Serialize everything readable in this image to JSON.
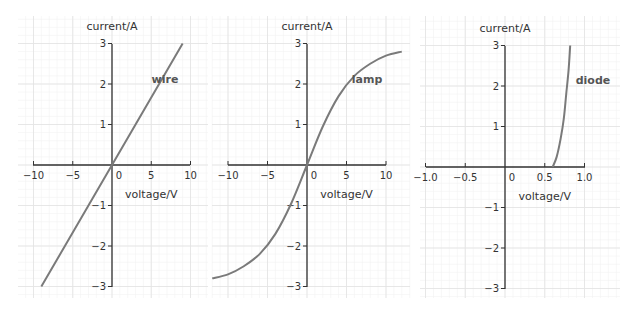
{
  "colors": {
    "background": "#ffffff",
    "grid_major": "#e4e4e4",
    "grid_minor": "#f2f2f2",
    "axis": "#333333",
    "curve": "#7a7a7a",
    "text": "#333333"
  },
  "chart_data": [
    {
      "type": "line",
      "title": "",
      "curve_label": "wire",
      "xlabel": "voltage/V",
      "ylabel": "current/A",
      "xlim": [
        -10,
        10
      ],
      "ylim": [
        -3,
        3
      ],
      "x_ticks": [
        -10,
        -5,
        0,
        5,
        10
      ],
      "x_tick_labels": [
        "−10",
        "−5",
        "0",
        "5",
        "10"
      ],
      "y_ticks": [
        -3,
        -2,
        -1,
        1,
        2,
        3
      ],
      "y_tick_labels": [
        "−3",
        "−2",
        "−1",
        "1",
        "2",
        "3"
      ],
      "grid": true,
      "series": [
        {
          "name": "wire",
          "x": [
            -9,
            -6,
            -3,
            0,
            3,
            6,
            9
          ],
          "y": [
            -3,
            -2,
            -1,
            0,
            1,
            2,
            3
          ]
        }
      ]
    },
    {
      "type": "line",
      "title": "",
      "curve_label": "lamp",
      "xlabel": "voltage/V",
      "ylabel": "current/A",
      "xlim": [
        -10,
        10
      ],
      "ylim": [
        -3,
        3
      ],
      "x_ticks": [
        -10,
        -5,
        0,
        5,
        10
      ],
      "x_tick_labels": [
        "−10",
        "−5",
        "0",
        "5",
        "10"
      ],
      "y_ticks": [
        -3,
        -2,
        -1,
        1,
        2,
        3
      ],
      "y_tick_labels": [
        "−3",
        "−2",
        "−1",
        "1",
        "2",
        "3"
      ],
      "grid": true,
      "series": [
        {
          "name": "lamp",
          "x": [
            -12,
            -10,
            -8,
            -6,
            -4,
            -2,
            0,
            2,
            4,
            6,
            8,
            10,
            12
          ],
          "y": [
            -2.8,
            -2.7,
            -2.5,
            -2.2,
            -1.7,
            -0.95,
            0,
            0.95,
            1.7,
            2.2,
            2.5,
            2.7,
            2.8
          ]
        }
      ]
    },
    {
      "type": "line",
      "title": "",
      "curve_label": "diode",
      "xlabel": "voltage/V",
      "ylabel": "current/A",
      "xlim": [
        -1.0,
        1.0
      ],
      "ylim": [
        -3,
        3
      ],
      "x_ticks": [
        -1.0,
        -0.5,
        0,
        0.5,
        1.0
      ],
      "x_tick_labels": [
        "−1.0",
        "−0.5",
        "0",
        "0.5",
        "1.0"
      ],
      "y_ticks": [
        -3,
        -2,
        -1,
        1,
        2,
        3
      ],
      "y_tick_labels": [
        "−3",
        "−2",
        "−1",
        "1",
        "2",
        "3"
      ],
      "grid": true,
      "series": [
        {
          "name": "diode",
          "x": [
            0.6,
            0.65,
            0.7,
            0.74,
            0.77,
            0.8,
            0.82
          ],
          "y": [
            0,
            0.25,
            0.7,
            1.2,
            1.8,
            2.4,
            3.0
          ]
        }
      ]
    }
  ]
}
